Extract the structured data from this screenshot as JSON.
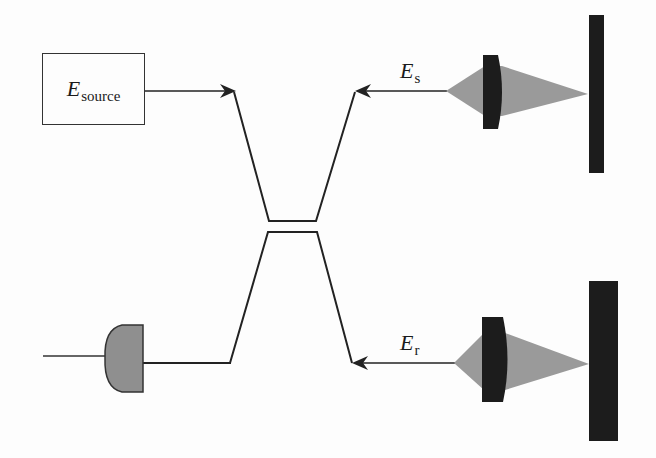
{
  "diagram": {
    "type": "fiber-optic interferometer (OCT) schematic",
    "source": {
      "symbol": "E",
      "subscript": "source"
    },
    "sample_arm": {
      "symbol": "E",
      "subscript": "s"
    },
    "reference_arm": {
      "symbol": "E",
      "subscript": "r"
    },
    "components": [
      "source",
      "fiber-coupler",
      "sample-lens",
      "sample-mirror",
      "reference-lens",
      "reference-mirror",
      "detector"
    ],
    "colors": {
      "line": "#222222",
      "beam": "#9a9a9a",
      "optic": "#1c1c1c",
      "detector_fill": "#8f8f8f",
      "background": "#fdfdfd"
    }
  }
}
